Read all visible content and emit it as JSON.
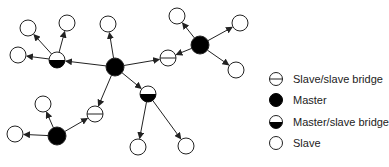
{
  "diagram": {
    "colors": {
      "stroke": "#222222",
      "fill_master": "#000000",
      "fill_slave": "#ffffff"
    },
    "nodes": [
      {
        "id": "m1",
        "type": "master",
        "x": 115,
        "y": 67
      },
      {
        "id": "s_top",
        "type": "slave",
        "x": 108,
        "y": 24
      },
      {
        "id": "b1",
        "type": "master_slave_bridge",
        "x": 57,
        "y": 60
      },
      {
        "id": "s_b1a",
        "type": "slave",
        "x": 28,
        "y": 28
      },
      {
        "id": "s_b1b",
        "type": "slave",
        "x": 67,
        "y": 23
      },
      {
        "id": "s_b1c",
        "type": "slave",
        "x": 18,
        "y": 55
      },
      {
        "id": "ss1",
        "type": "slave_slave_bridge",
        "x": 168,
        "y": 58
      },
      {
        "id": "m2",
        "type": "master",
        "x": 200,
        "y": 45
      },
      {
        "id": "s_m2a",
        "type": "slave",
        "x": 177,
        "y": 16
      },
      {
        "id": "s_m2b",
        "type": "slave",
        "x": 240,
        "y": 23
      },
      {
        "id": "s_m2c",
        "type": "slave",
        "x": 236,
        "y": 70
      },
      {
        "id": "b2",
        "type": "master_slave_bridge",
        "x": 148,
        "y": 94
      },
      {
        "id": "s_b2a",
        "type": "slave",
        "x": 138,
        "y": 147
      },
      {
        "id": "s_b2b",
        "type": "slave",
        "x": 186,
        "y": 146
      },
      {
        "id": "ss2",
        "type": "slave_slave_bridge",
        "x": 95,
        "y": 114
      },
      {
        "id": "m3",
        "type": "master",
        "x": 57,
        "y": 136
      },
      {
        "id": "s_m3a",
        "type": "slave",
        "x": 43,
        "y": 104
      },
      {
        "id": "s_m3b",
        "type": "slave",
        "x": 15,
        "y": 134
      }
    ],
    "edges": [
      {
        "from": "m1",
        "to": "s_top"
      },
      {
        "from": "m1",
        "to": "b1"
      },
      {
        "from": "m1",
        "to": "ss1"
      },
      {
        "from": "m1",
        "to": "b2"
      },
      {
        "from": "m1",
        "to": "ss2"
      },
      {
        "from": "b1",
        "to": "s_b1a"
      },
      {
        "from": "b1",
        "to": "s_b1b"
      },
      {
        "from": "b1",
        "to": "s_b1c"
      },
      {
        "from": "m2",
        "to": "ss1"
      },
      {
        "from": "m2",
        "to": "s_m2a"
      },
      {
        "from": "m2",
        "to": "s_m2b"
      },
      {
        "from": "m2",
        "to": "s_m2c"
      },
      {
        "from": "b2",
        "to": "s_b2a"
      },
      {
        "from": "b2",
        "to": "s_b2b"
      },
      {
        "from": "m3",
        "to": "ss2"
      },
      {
        "from": "m3",
        "to": "s_m3a"
      },
      {
        "from": "m3",
        "to": "s_m3b"
      }
    ]
  },
  "legend": {
    "items": [
      {
        "type": "slave_slave_bridge",
        "label": "Slave/slave bridge"
      },
      {
        "type": "master",
        "label": "Master"
      },
      {
        "type": "master_slave_bridge",
        "label": "Master/slave bridge"
      },
      {
        "type": "slave",
        "label": "Slave"
      }
    ]
  }
}
